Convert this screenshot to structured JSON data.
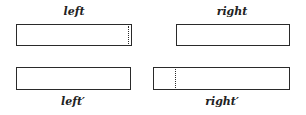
{
  "diagram": {
    "labels": {
      "left": "left",
      "right": "right",
      "left_prime": "left′",
      "right_prime": "right′"
    },
    "nodes": [
      {
        "id": "left",
        "label": "left",
        "row": "top",
        "has_dotted_divider": true,
        "divider_side": "right"
      },
      {
        "id": "right",
        "label": "right",
        "row": "top",
        "has_dotted_divider": false
      },
      {
        "id": "left_prime",
        "label": "left′",
        "row": "bottom",
        "has_dotted_divider": false
      },
      {
        "id": "right_prime",
        "label": "right′",
        "row": "bottom",
        "has_dotted_divider": true,
        "divider_side": "left"
      }
    ],
    "colors": {
      "stroke": "#2a2a2a",
      "background": "#ffffff",
      "text": "#222222"
    }
  }
}
